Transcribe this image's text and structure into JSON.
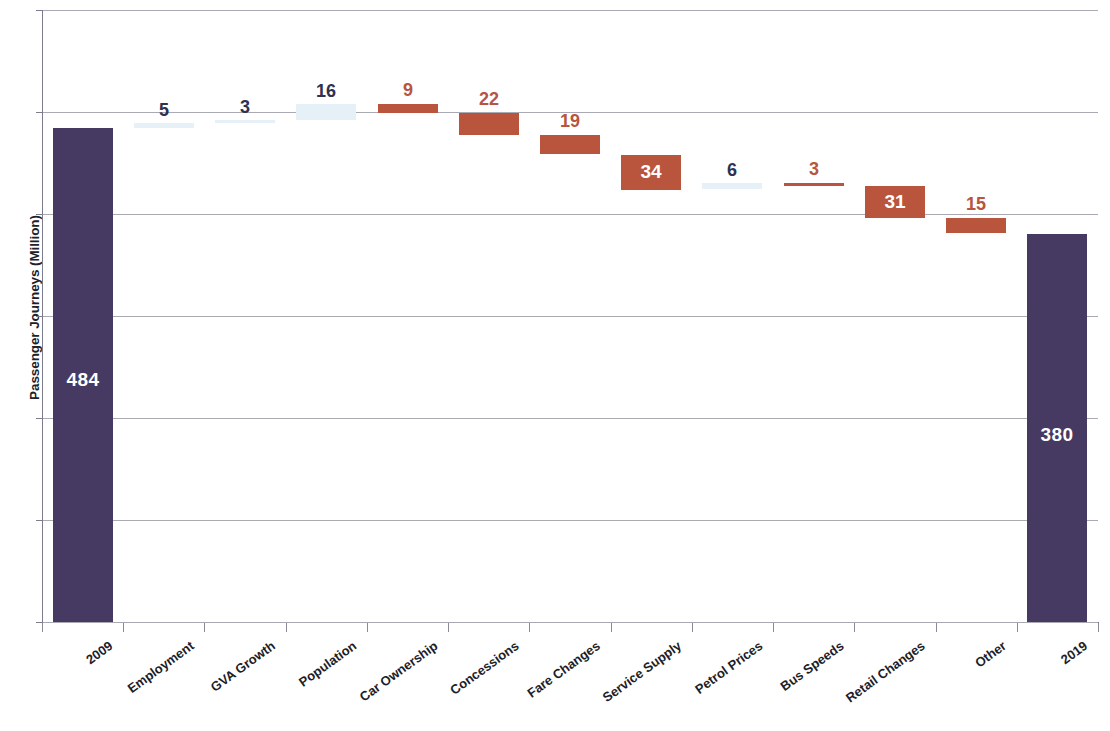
{
  "chart_data": {
    "type": "bar",
    "subtype": "waterfall",
    "title": "",
    "xlabel": "",
    "ylabel": "Passenger Journeys (Million)",
    "ylim": [
      0,
      600
    ],
    "grid": true,
    "legend": "none",
    "categories": [
      "2009",
      "Employment",
      "GVA Growth",
      "Population",
      "Car Ownership",
      "Concessions",
      "Fare Changes",
      "Service Supply",
      "Petrol Prices",
      "Bus Speeds",
      "Retail Changes",
      "Other",
      "2019"
    ],
    "values": [
      484,
      5,
      3,
      16,
      -9,
      -22,
      -19,
      -34,
      6,
      -3,
      -31,
      -15,
      380
    ],
    "labels": [
      "484",
      "5",
      "3",
      "16",
      "9",
      "22",
      "19",
      "34",
      "6",
      "3",
      "31",
      "15",
      "380"
    ],
    "kinds": [
      "total",
      "up",
      "up",
      "up",
      "down",
      "down",
      "down",
      "down",
      "up",
      "down",
      "down",
      "down",
      "total"
    ],
    "cumulative_start": [
      0,
      484,
      489,
      492,
      508,
      499,
      477,
      458,
      424,
      430,
      427,
      396,
      0
    ],
    "cumulative_end": [
      484,
      489,
      492,
      508,
      499,
      477,
      458,
      424,
      430,
      427,
      396,
      381,
      380
    ],
    "colors": {
      "total_bar": "#463a63",
      "decrease_bar": "#b8553c",
      "increase_bar": "#e6f0f7",
      "increase_label": "#2e3150",
      "decrease_label": "#b8553c",
      "inside_label": "#ffffff",
      "gridline": "#a9a9b4",
      "axis": "#6b6b7a"
    }
  },
  "axis": {
    "y_title": "Passenger Journeys (Million)"
  }
}
